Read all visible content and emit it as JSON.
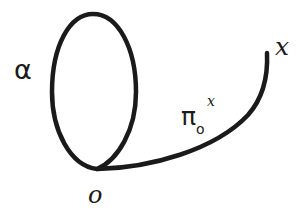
{
  "diagram": {
    "type": "loop-and-path",
    "labels": {
      "loop": "α",
      "endpoint": "x",
      "basepoint": "o",
      "path_symbol": "π",
      "path_subscript": "o",
      "path_superscript": "x"
    },
    "colors": {
      "stroke": "#1a1a1a",
      "background": "#ffffff"
    },
    "geometry": {
      "loop": {
        "cx": 94,
        "cy": 91,
        "rx": 42,
        "ry": 77
      },
      "basepoint": {
        "x": 97,
        "y": 169
      },
      "endpoint": {
        "x": 267,
        "y": 53
      }
    }
  }
}
